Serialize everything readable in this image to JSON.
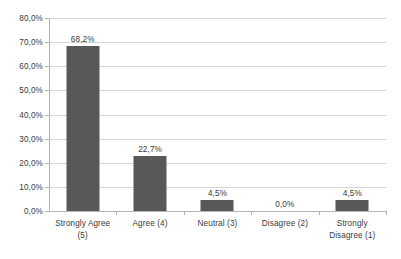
{
  "chart_data": {
    "type": "bar",
    "title": "",
    "subtitle": "",
    "xlabel": "",
    "ylabel": "",
    "categories": [
      "Strongly Agree (5)",
      "Agree (4)",
      "Neutral (3)",
      "Disagree (2)",
      "Strongly Disagree (1)"
    ],
    "category_lines": [
      [
        "Strongly Agree",
        "(5)"
      ],
      [
        "Agree (4)"
      ],
      [
        "Neutral (3)"
      ],
      [
        "Disagree (2)"
      ],
      [
        "Strongly",
        "Disagree (1)"
      ]
    ],
    "values": [
      68.2,
      22.7,
      4.5,
      0.0,
      4.5
    ],
    "value_labels": [
      "68,2%",
      "22,7%",
      "4,5%",
      "0,0%",
      "4,5%"
    ],
    "ylim": [
      0,
      80
    ],
    "ytick_values": [
      0,
      10,
      20,
      30,
      40,
      50,
      60,
      70,
      80
    ],
    "ytick_labels": [
      "0,0%",
      "10,0%",
      "20,0%",
      "30,0%",
      "40,0%",
      "50,0%",
      "60,0%",
      "70,0%",
      "80,0%"
    ],
    "grid": true,
    "legend": false,
    "legend_position": "none",
    "decimal_separator": ",",
    "colors": {
      "bar": "#585858",
      "gridline": "#d6d6d6",
      "axis": "#b0b0b0",
      "text": "#3b3b3b",
      "background": "#ffffff"
    }
  }
}
